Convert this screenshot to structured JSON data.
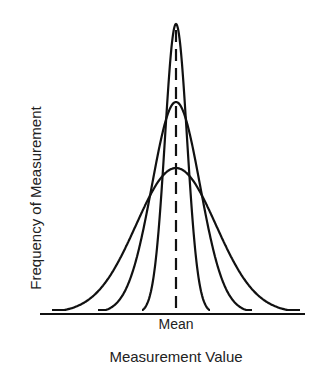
{
  "chart_data": {
    "type": "line",
    "title": "",
    "xlabel": "Measurement Value",
    "ylabel": "Frequency of Measurement",
    "x_tick_labels": [
      "Mean"
    ],
    "grid": false,
    "legend": null,
    "annotations": [
      {
        "type": "dashed-vertical-line",
        "at": "Mean"
      }
    ],
    "series": [
      {
        "name": "narrow distribution",
        "center_px": 176,
        "peak_height_px": 289,
        "sigma_px": 11,
        "extent_px": [
          142,
          210
        ]
      },
      {
        "name": "medium distribution",
        "center_px": 176,
        "peak_height_px": 211,
        "sigma_px": 24,
        "extent_px": [
          98,
          252
        ]
      },
      {
        "name": "wide distribution",
        "center_px": 176,
        "peak_height_px": 145,
        "sigma_px": 40,
        "extent_px": [
          52,
          300
        ]
      }
    ],
    "layout": {
      "baseline_y": 313,
      "axis_x_range_px": [
        40,
        305
      ],
      "stroke": "#111111"
    }
  }
}
